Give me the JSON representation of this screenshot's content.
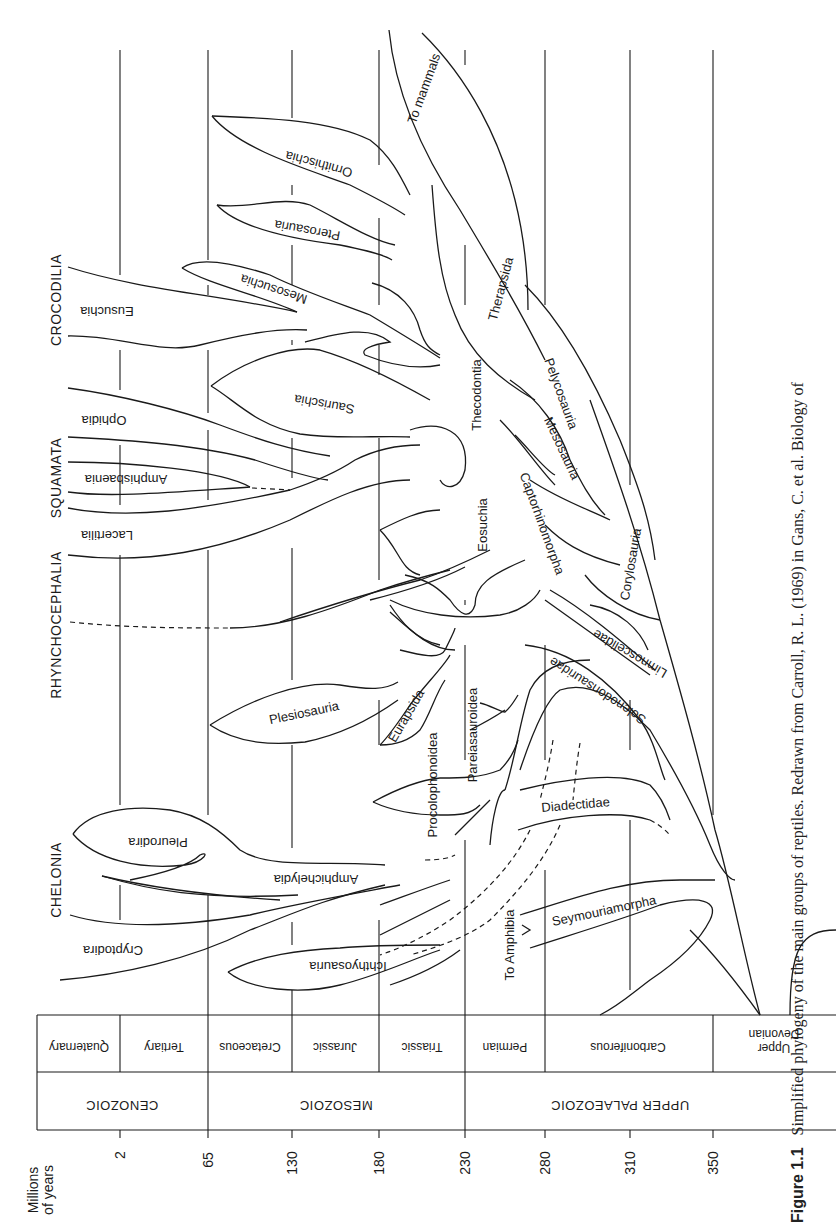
{
  "caption": {
    "label": "Figure 1.1",
    "text": "Simplified phylogeny of the main groups of reptiles. Redrawn from Carroll, R. L. (1969) in Gans, C. et al. Biology of"
  },
  "axis": {
    "title_line1": "Millions",
    "title_line2": "of years",
    "ticks": [
      "2",
      "65",
      "130",
      "180",
      "230",
      "280",
      "310",
      "350"
    ]
  },
  "eras": [
    "CENOZOIC",
    "MESOZOIC",
    "UPPER PALAEOZOIC"
  ],
  "periods": [
    "Quaternary",
    "Tertiary",
    "Cretaceous",
    "Jurassic",
    "Triassic",
    "Permian",
    "Carboniferous",
    "Upper Devonian"
  ],
  "clades": {
    "crocodilia": "CROCODILIA",
    "squamata": "SQUAMATA",
    "rhynchocephalia": "RHYNCHOCEPHALIA",
    "chelonia": "CHELONIA"
  },
  "taxa": {
    "to_mammals": "To mammals",
    "ornithischia": "Ornithischia",
    "pterosauria": "Pterosauria",
    "mesosuchia": "Mesosuchia",
    "eusuchia": "Eusuchia",
    "saurischia": "Saurischia",
    "ophidia": "Ophidia",
    "amphisbaenia": "Amphisbaenia",
    "lacertilia": "Lacertilia",
    "therapsida": "Therapsida",
    "thecodontia": "Thecodontia",
    "pelycosauria": "Pelycosauria",
    "mesosauria": "Mesosauria",
    "eosuchia": "Eosuchia",
    "captorhinomorpha": "Captorhinomorpha",
    "corylosauria": "Corylosauria",
    "limnoscelidae": "Limnoscelidae",
    "solenodonsauridae": "Solenodonsauridae",
    "plesiosauria": "Plesiosauria",
    "eurapsida": "Eurapsida",
    "pareiasauroidea": "Pareiasauroidea",
    "procolophonoidea": "Procolophonoidea",
    "diadectidae": "Diadectidae",
    "pleurodira": "Pleurodira",
    "amphichelydia": "Amphichelydia",
    "cryptodira": "Cryptodira",
    "ichthyosauria": "Ichthyosauria",
    "to_amphibia": "To Amphibia",
    "seymouriamorpha": "Seymouriamorpha"
  }
}
